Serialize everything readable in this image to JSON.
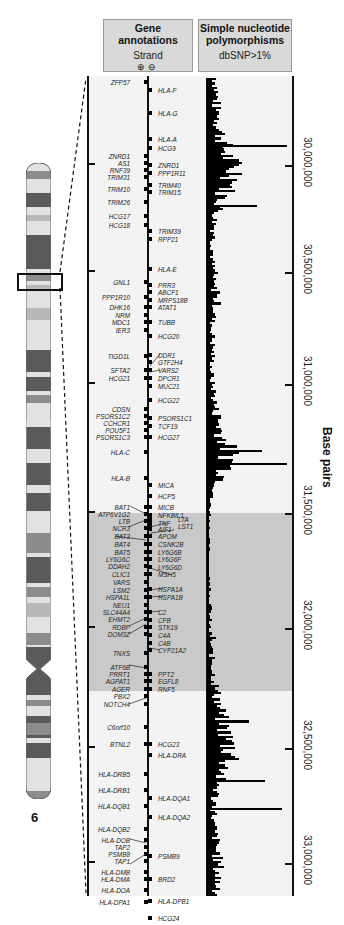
{
  "header": {
    "genes_title": "Gene annotations",
    "strand_label": "Strand",
    "strand_plus": "⊕",
    "strand_minus": "⊖",
    "snp_title_line1": "Simple nucleotide",
    "snp_title_line2": "polymorphisms",
    "snp_subtitle": "dbSNP>1%"
  },
  "axis": {
    "title": "Base pairs",
    "ticks": [
      {
        "label": "30,000,000",
        "y": 165
      },
      {
        "label": "30,500,000",
        "y": 272
      },
      {
        "label": "31,000,000",
        "y": 384
      },
      {
        "label": "31,500,000",
        "y": 513
      },
      {
        "label": "32,000,000",
        "y": 628
      },
      {
        "label": "32,500,000",
        "y": 748
      },
      {
        "label": "33,000,000",
        "y": 863
      }
    ]
  },
  "chromosome": {
    "label": "6",
    "colors": {
      "dark": "#5a5a5a",
      "mid": "#8c8c8c",
      "light": "#e2e2e2",
      "pale": "#b8b8b8"
    }
  },
  "genes_left": [
    {
      "name": "ZFP57",
      "y": 83
    },
    {
      "name": "ZNRD1",
      "y": 157
    },
    {
      "name": "AS1",
      "y": 164
    },
    {
      "name": "RNF39",
      "y": 171
    },
    {
      "name": "TRIM31",
      "y": 178
    },
    {
      "name": "TRIM10",
      "y": 190
    },
    {
      "name": "TRIM26",
      "y": 203
    },
    {
      "name": "HCG17",
      "y": 217
    },
    {
      "name": "HCG18",
      "y": 226
    },
    {
      "name": "GNL1",
      "y": 283
    },
    {
      "name": "PPP1R10",
      "y": 298
    },
    {
      "name": "DHK16",
      "y": 308
    },
    {
      "name": "NRM",
      "y": 316
    },
    {
      "name": "MDC1",
      "y": 323
    },
    {
      "name": "IER3",
      "y": 331
    },
    {
      "name": "TIGD1L",
      "y": 357
    },
    {
      "name": "SFTA2",
      "y": 371
    },
    {
      "name": "HCG21",
      "y": 379
    },
    {
      "name": "CDSN",
      "y": 410
    },
    {
      "name": "PSORS1C2",
      "y": 417
    },
    {
      "name": "CCHCR1",
      "y": 424
    },
    {
      "name": "POU5F1",
      "y": 431
    },
    {
      "name": "PSORS1C3",
      "y": 438
    },
    {
      "name": "HLA-C",
      "y": 453
    },
    {
      "name": "HLA-B",
      "y": 479
    },
    {
      "name": "BAT1",
      "y": 508
    },
    {
      "name": "ATP6V1G2",
      "y": 515
    },
    {
      "name": "LTB",
      "y": 522
    },
    {
      "name": "NCR3",
      "y": 529
    },
    {
      "name": "BAT3",
      "y": 537
    },
    {
      "name": "BAT4",
      "y": 545
    },
    {
      "name": "BAT5",
      "y": 553
    },
    {
      "name": "LY6G6C",
      "y": 560
    },
    {
      "name": "DDAH2",
      "y": 567
    },
    {
      "name": "CLIC1",
      "y": 575
    },
    {
      "name": "VARS",
      "y": 583
    },
    {
      "name": "LSM2",
      "y": 591
    },
    {
      "name": "HSPA1L",
      "y": 598
    },
    {
      "name": "NEU1",
      "y": 606
    },
    {
      "name": "SLC44A4",
      "y": 613
    },
    {
      "name": "EHMT2",
      "y": 620
    },
    {
      "name": "RDBP",
      "y": 628
    },
    {
      "name": "DOM3Z",
      "y": 635
    },
    {
      "name": "TNXS",
      "y": 654
    },
    {
      "name": "ATF6B",
      "y": 668
    },
    {
      "name": "PRRT1",
      "y": 675
    },
    {
      "name": "AGPAT1",
      "y": 682
    },
    {
      "name": "AGER",
      "y": 690
    },
    {
      "name": "PBX2",
      "y": 697
    },
    {
      "name": "NOTCH4",
      "y": 705
    },
    {
      "name": "C6orf10",
      "y": 728
    },
    {
      "name": "BTNL2",
      "y": 745
    },
    {
      "name": "HLA-DRB5",
      "y": 775
    },
    {
      "name": "HLA-DRB1",
      "y": 791
    },
    {
      "name": "HLA-DQB1",
      "y": 807
    },
    {
      "name": "HLA-DQB2",
      "y": 830
    },
    {
      "name": "HLA-DOB",
      "y": 841
    },
    {
      "name": "TAP2",
      "y": 848
    },
    {
      "name": "PSMB8",
      "y": 855
    },
    {
      "name": "TAP1",
      "y": 862
    },
    {
      "name": "HLA-DMB",
      "y": 873
    },
    {
      "name": "HLA-DMA",
      "y": 880
    },
    {
      "name": "HLA-DOA",
      "y": 891
    },
    {
      "name": "HLA-DPA1",
      "y": 903
    }
  ],
  "genes_right": [
    {
      "name": "HLA-F",
      "y": 91
    },
    {
      "name": "HLA-G",
      "y": 114
    },
    {
      "name": "HLA-A",
      "y": 140
    },
    {
      "name": "HCG9",
      "y": 149
    },
    {
      "name": "ZNRD1",
      "y": 166
    },
    {
      "name": "PPP1R11",
      "y": 174
    },
    {
      "name": "TRIM40",
      "y": 186
    },
    {
      "name": "TRIM15",
      "y": 193
    },
    {
      "name": "TRIM39",
      "y": 232
    },
    {
      "name": "RPP21",
      "y": 240
    },
    {
      "name": "HLA-E",
      "y": 270
    },
    {
      "name": "PRR3",
      "y": 286
    },
    {
      "name": "ABCF1",
      "y": 293
    },
    {
      "name": "MRPS18B",
      "y": 301
    },
    {
      "name": "ATAT1",
      "y": 308
    },
    {
      "name": "TUBB",
      "y": 323
    },
    {
      "name": "HCG20",
      "y": 337
    },
    {
      "name": "DDR1",
      "y": 356
    },
    {
      "name": "GTF2H4",
      "y": 363
    },
    {
      "name": "VARS2",
      "y": 371
    },
    {
      "name": "DPCR1",
      "y": 379
    },
    {
      "name": "MUC21",
      "y": 387
    },
    {
      "name": "HCG22",
      "y": 401
    },
    {
      "name": "PSORS1C1",
      "y": 419
    },
    {
      "name": "TCF19",
      "y": 427
    },
    {
      "name": "HCG27",
      "y": 438
    },
    {
      "name": "MICA",
      "y": 486
    },
    {
      "name": "HCP5",
      "y": 497
    },
    {
      "name": "MICB",
      "y": 508
    },
    {
      "name": "NFKBIL1",
      "y": 516
    },
    {
      "name": "TNF",
      "y": 524
    },
    {
      "name": "AIF1",
      "y": 530
    },
    {
      "name": "APOM",
      "y": 537
    },
    {
      "name": "CSNK2B",
      "y": 545
    },
    {
      "name": "LY6G6B",
      "y": 553
    },
    {
      "name": "LY6G6F",
      "y": 560
    },
    {
      "name": "LY6G6D",
      "y": 568
    },
    {
      "name": "MSH5",
      "y": 575
    },
    {
      "name": "HSPA1A",
      "y": 590
    },
    {
      "name": "HSPA1B",
      "y": 598
    },
    {
      "name": "C2",
      "y": 613
    },
    {
      "name": "CFB",
      "y": 621
    },
    {
      "name": "STK19",
      "y": 628
    },
    {
      "name": "C4A",
      "y": 636
    },
    {
      "name": "C4B",
      "y": 644
    },
    {
      "name": "CYP21A2",
      "y": 651
    },
    {
      "name": "PPT2",
      "y": 675
    },
    {
      "name": "EGFL8",
      "y": 682
    },
    {
      "name": "RNF5",
      "y": 690
    },
    {
      "name": "HCG23",
      "y": 745
    },
    {
      "name": "HLA-DRA",
      "y": 756
    },
    {
      "name": "HLA-DQA1",
      "y": 799
    },
    {
      "name": "HLA-DQA2",
      "y": 818
    },
    {
      "name": "PSMB9",
      "y": 857
    },
    {
      "name": "BRD2",
      "y": 880
    },
    {
      "name": "HLA-DPB1",
      "y": 902
    },
    {
      "name": "HCG24",
      "y": 919
    }
  ],
  "genes_far_right": [
    {
      "name": "LTA",
      "y": 520
    },
    {
      "name": "LST1",
      "y": 527
    }
  ],
  "chart_data": {
    "type": "bar",
    "orientation": "horizontal",
    "xlabel": "SNP density (relative)",
    "ylabel": "Base pairs",
    "ylim": [
      29600000,
      33400000
    ],
    "shaded_region": {
      "label": "class III region",
      "start": 31500000,
      "end": 32300000
    },
    "tick_labels": [
      "30,000,000",
      "30,500,000",
      "31,000,000",
      "31,500,000",
      "32,000,000",
      "32,500,000",
      "33,000,000"
    ],
    "position_mb": [
      29.65,
      29.75,
      29.85,
      29.95,
      30.05,
      30.15,
      30.25,
      30.35,
      30.45,
      30.55,
      30.65,
      30.75,
      30.85,
      30.95,
      31.05,
      31.15,
      31.25,
      31.35,
      31.45,
      31.55,
      31.65,
      31.75,
      31.85,
      31.95,
      32.05,
      32.15,
      32.25,
      32.35,
      32.45,
      32.55,
      32.65,
      32.75,
      32.85,
      32.95,
      33.05,
      33.15,
      33.25
    ],
    "values": [
      20,
      22,
      30,
      45,
      68,
      35,
      18,
      15,
      12,
      14,
      22,
      10,
      14,
      10,
      14,
      20,
      32,
      55,
      40,
      8,
      6,
      5,
      4,
      5,
      8,
      6,
      10,
      14,
      22,
      30,
      42,
      60,
      28,
      18,
      14,
      20,
      25
    ]
  }
}
